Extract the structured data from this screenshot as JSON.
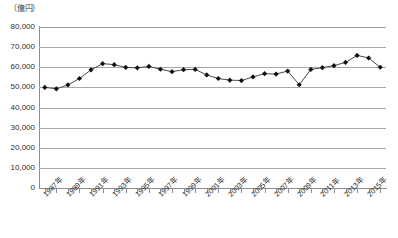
{
  "chart_data": {
    "type": "line",
    "title": "",
    "subtitle": "",
    "xlabel": "",
    "ylabel": "",
    "unit_label": "（億円）",
    "ylim": [
      0,
      80000
    ],
    "ytick_values": [
      0,
      10000,
      20000,
      30000,
      40000,
      50000,
      60000,
      70000,
      80000
    ],
    "ytick_labels": [
      "0",
      "10,000",
      "20,000",
      "30,000",
      "40,000",
      "50,000",
      "60,000",
      "70,000",
      "80,000"
    ],
    "grid": true,
    "legend": "none",
    "marker": "diamond",
    "line_color": "#4a4a4a",
    "marker_color": "#111111",
    "x": [
      1987,
      1988,
      1989,
      1990,
      1991,
      1992,
      1993,
      1994,
      1995,
      1996,
      1997,
      1998,
      1999,
      2000,
      2001,
      2002,
      2003,
      2004,
      2005,
      2006,
      2007,
      2008,
      2009,
      2010,
      2011,
      2012,
      2013,
      2014,
      2015,
      2016
    ],
    "xtick_labels": [
      "1987年",
      "1989年",
      "1991年",
      "1993年",
      "1995年",
      "1997年",
      "1999年",
      "2001年",
      "2003年",
      "2005年",
      "2007年",
      "2009年",
      "2011年",
      "2013年",
      "2015年"
    ],
    "xtick_label_years": [
      1987,
      1989,
      1991,
      1993,
      1995,
      1997,
      1999,
      2001,
      2003,
      2005,
      2007,
      2009,
      2011,
      2013,
      2015
    ],
    "values": [
      50000,
      49300,
      51200,
      54400,
      58700,
      61800,
      61300,
      59900,
      59700,
      60400,
      59000,
      57800,
      58800,
      58900,
      56200,
      54400,
      53600,
      53400,
      55200,
      56800,
      56600,
      58100,
      51300,
      58900,
      59800,
      60800,
      62400,
      65900,
      64600,
      60000
    ],
    "series_name": ""
  }
}
